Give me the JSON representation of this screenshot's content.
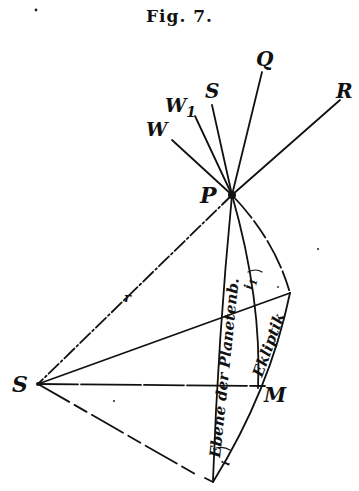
{
  "figure": {
    "title": "Fig. 7."
  },
  "labels": {
    "Q": "Q",
    "R": "R",
    "S_top": "S",
    "W1": "W",
    "W1_sub": "1",
    "W": "W",
    "P": "P",
    "S_left": "S",
    "M": "M",
    "r": "r",
    "i1": "i",
    "i1_sub": "1",
    "i": "i",
    "plane_planet": "Ebene der Planetenb.",
    "ecliptic": "Ekliptik"
  },
  "colors": {
    "ink": "#111111",
    "background": "#ffffff"
  }
}
